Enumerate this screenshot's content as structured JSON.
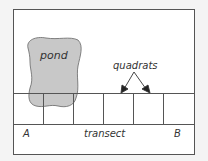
{
  "diagram": {
    "labels": {
      "pond": "pond",
      "quadrats": "quadrats",
      "start": "A",
      "transect": "transect",
      "end": "B"
    },
    "quadrat_count": 6,
    "colors": {
      "pond_fill": "#c8c8c8",
      "line": "#555555",
      "background": "#ffffff",
      "page": "#f4f4f4"
    }
  }
}
